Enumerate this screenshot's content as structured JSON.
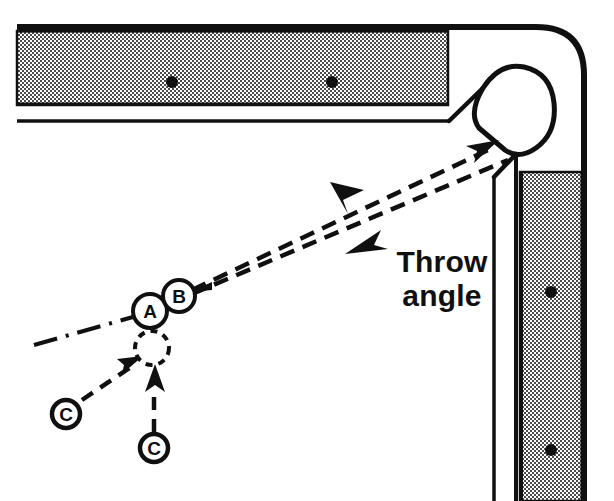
{
  "diagram": {
    "type": "billiards-shot-diagram",
    "colors": {
      "ink": "#101010",
      "rail_fill": "#b9b9b9",
      "table_bed": "#ffffff",
      "page_background": "#ffffff"
    },
    "annotations": {
      "throw_label_line1": "Throw",
      "throw_label_line2": "angle"
    },
    "balls": [
      {
        "id": "ball-a",
        "label": "A",
        "cx": 150,
        "cy": 311,
        "r": 17,
        "style": "solid"
      },
      {
        "id": "ball-b",
        "label": "B",
        "cx": 179,
        "cy": 296,
        "r": 16,
        "style": "solid"
      },
      {
        "id": "ghost-ball",
        "label": "",
        "cx": 152,
        "cy": 348,
        "r": 17,
        "style": "dashed"
      }
    ],
    "cue_labels": [
      {
        "id": "cue-label-left",
        "label": "C",
        "cx": 66,
        "cy": 414,
        "r": 14
      },
      {
        "id": "cue-label-bottom",
        "label": "C",
        "cx": 154,
        "cy": 448,
        "r": 14
      }
    ],
    "rail_diamonds": [
      {
        "id": "diamond-top-1",
        "cx": 172,
        "cy": 82,
        "r": 6
      },
      {
        "id": "diamond-top-2",
        "cx": 332,
        "cy": 82,
        "r": 6
      },
      {
        "id": "diamond-right-1",
        "cx": 551,
        "cy": 292,
        "r": 6
      },
      {
        "id": "diamond-right-2",
        "cx": 551,
        "cy": 450,
        "r": 6
      }
    ],
    "paths": {
      "aim_line_label": "aim line",
      "throw_line_upper_label": "ideal path to pocket",
      "throw_line_lower_label": "actual thrown path",
      "cue_path_diagonal_label": "cue ball path C (diagonal)",
      "cue_path_vertical_label": "cue ball path C (vertical)",
      "tangent_line_label": "tangent / aim dash-dot line"
    },
    "pocket": {
      "id": "corner-pocket",
      "label": "corner pocket"
    }
  }
}
